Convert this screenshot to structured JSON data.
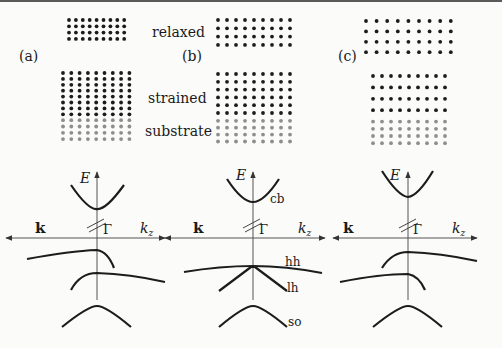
{
  "figure": {
    "colors": {
      "strained_atom": "#1c1c1c",
      "substrate_atom": "#8e8e8e",
      "curve": "#1c1c1c",
      "axis": "#555555",
      "text": "#1a1a1a",
      "top_rule": "#5a5a5a"
    },
    "labels": {
      "relaxed": "relaxed",
      "strained": "strained",
      "substrate": "substrate"
    },
    "panels": [
      {
        "id": "a",
        "tag": "(a)",
        "relaxed_lattice": {
          "cols": 9,
          "rows": 4
        },
        "strained_lattice": {
          "cols": 9,
          "rows": 8
        },
        "substrate_lattice": {
          "cols": 9,
          "rows": 4
        },
        "axis": {
          "energy_label": "E",
          "left_label": "k",
          "right_label": "kz",
          "right_label_main": "k",
          "right_label_sub": "z",
          "gamma_label": "Γ"
        },
        "band_labels": []
      },
      {
        "id": "b",
        "tag": "(b)",
        "relaxed_lattice": {
          "cols": 9,
          "rows": 4
        },
        "strained_lattice": {
          "cols": 9,
          "rows": 6
        },
        "substrate_lattice": {
          "cols": 9,
          "rows": 4
        },
        "axis": {
          "energy_label": "E",
          "left_label": "k",
          "right_label": "kz",
          "right_label_main": "k",
          "right_label_sub": "z",
          "gamma_label": "Γ"
        },
        "band_labels": [
          "cb",
          "hh",
          "lh",
          "so"
        ]
      },
      {
        "id": "c",
        "tag": "(c)",
        "relaxed_lattice": {
          "cols": 9,
          "rows": 4
        },
        "strained_lattice": {
          "cols": 9,
          "rows": 4
        },
        "substrate_lattice": {
          "cols": 9,
          "rows": 4
        },
        "axis": {
          "energy_label": "E",
          "left_label": "k",
          "right_label": "kz",
          "right_label_main": "k",
          "right_label_sub": "z",
          "gamma_label": "Γ"
        },
        "band_labels": []
      }
    ]
  }
}
